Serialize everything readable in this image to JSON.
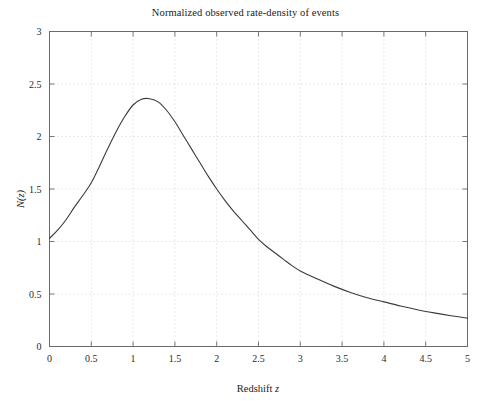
{
  "chart_data": {
    "type": "line",
    "title": "Normalized observed rate-density of events",
    "xlabel": "Redshift z",
    "ylabel": "N(z)",
    "xlim": [
      0,
      5
    ],
    "ylim": [
      0,
      3
    ],
    "grid": true,
    "grid_style": "dotted",
    "legend": null,
    "line_color": "#3b3b3b",
    "background_color": "#ffffff",
    "axis_color": "#555555",
    "xticks": [
      "0",
      "0.5",
      "1",
      "1.5",
      "2",
      "2.5",
      "3",
      "3.5",
      "4",
      "4.5",
      "5"
    ],
    "xtick_values": [
      0,
      0.5,
      1,
      1.5,
      2,
      2.5,
      3,
      3.5,
      4,
      4.5,
      5
    ],
    "yticks": [
      "0",
      "0.5",
      "1",
      "1.5",
      "2",
      "2.5",
      "3"
    ],
    "ytick_values": [
      0,
      0.5,
      1,
      1.5,
      2,
      2.5,
      3
    ],
    "series": [
      {
        "name": "N(z)",
        "x": [
          0.0,
          0.1,
          0.2,
          0.3,
          0.4,
          0.5,
          0.6,
          0.7,
          0.8,
          0.9,
          1.0,
          1.1,
          1.2,
          1.3,
          1.4,
          1.5,
          1.6,
          1.7,
          1.8,
          1.9,
          2.0,
          2.1,
          2.2,
          2.3,
          2.4,
          2.5,
          2.6,
          2.7,
          2.8,
          2.9,
          3.0,
          3.2,
          3.4,
          3.6,
          3.8,
          4.0,
          4.2,
          4.4,
          4.6,
          4.8,
          5.0
        ],
        "y": [
          1.03,
          1.11,
          1.21,
          1.33,
          1.44,
          1.56,
          1.72,
          1.89,
          2.05,
          2.19,
          2.3,
          2.355,
          2.36,
          2.33,
          2.25,
          2.14,
          2.01,
          1.88,
          1.75,
          1.62,
          1.5,
          1.39,
          1.29,
          1.2,
          1.11,
          1.02,
          0.95,
          0.89,
          0.83,
          0.77,
          0.72,
          0.645,
          0.575,
          0.515,
          0.465,
          0.425,
          0.385,
          0.35,
          0.32,
          0.293,
          0.27
        ]
      }
    ],
    "annotations": {
      "peak_x": 1.15,
      "peak_y": 2.36,
      "start_value": 1.03,
      "end_value": 0.27
    }
  }
}
